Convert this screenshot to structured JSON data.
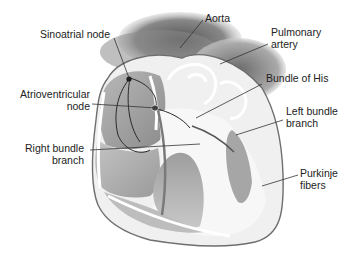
{
  "diagram": {
    "labels": {
      "sinoatrial_node": "Sinoatrial node",
      "atrioventricular_node_1": "Atrioventricular",
      "atrioventricular_node_2": "node",
      "right_bundle_branch_1": "Right bundle",
      "right_bundle_branch_2": "branch",
      "aorta": "Aorta",
      "pulmonary_artery_1": "Pulmonary",
      "pulmonary_artery_2": "artery",
      "bundle_of_his": "Bundle of His",
      "left_bundle_branch_1": "Left bundle",
      "left_bundle_branch_2": "branch",
      "purkinje_fibers_1": "Purkinje",
      "purkinje_fibers_2": "fibers"
    },
    "colors": {
      "background": "#ffffff",
      "label_text": "#222222",
      "leader_line": "#333333",
      "heart_outline": "#6e6e6e",
      "vessel_dark": "#5a5a5a",
      "tissue_mid": "#a8a8a8",
      "tissue_light": "#d6d6d6"
    }
  }
}
